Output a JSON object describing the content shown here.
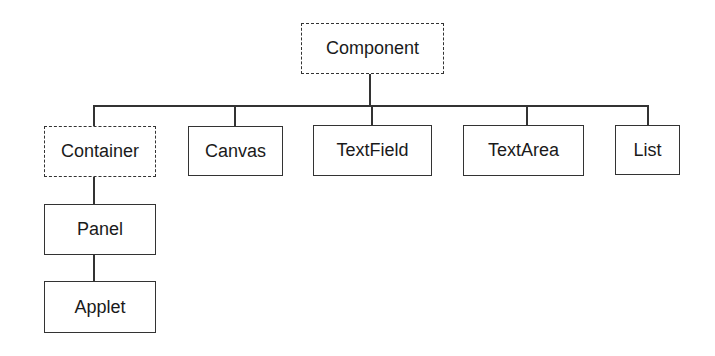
{
  "diagram": {
    "type": "class-hierarchy",
    "root": "Component",
    "nodes": [
      {
        "id": "component",
        "label": "Component",
        "style": "dashed",
        "abstract": true
      },
      {
        "id": "container",
        "label": "Container",
        "style": "dashed",
        "abstract": true,
        "parent": "component"
      },
      {
        "id": "canvas",
        "label": "Canvas",
        "style": "solid",
        "parent": "component"
      },
      {
        "id": "textfield",
        "label": "TextField",
        "style": "solid",
        "parent": "component"
      },
      {
        "id": "textarea",
        "label": "TextArea",
        "style": "solid",
        "parent": "component"
      },
      {
        "id": "list",
        "label": "List",
        "style": "solid",
        "parent": "component"
      },
      {
        "id": "panel",
        "label": "Panel",
        "style": "solid",
        "parent": "container"
      },
      {
        "id": "applet",
        "label": "Applet",
        "style": "solid",
        "parent": "panel"
      }
    ],
    "edges": [
      {
        "from": "component",
        "to": "container"
      },
      {
        "from": "component",
        "to": "canvas"
      },
      {
        "from": "component",
        "to": "textfield"
      },
      {
        "from": "component",
        "to": "textarea"
      },
      {
        "from": "component",
        "to": "list"
      },
      {
        "from": "container",
        "to": "panel"
      },
      {
        "from": "panel",
        "to": "applet"
      }
    ],
    "colors": {
      "stroke": "#333333",
      "text": "#1a1a1a",
      "background": "#ffffff"
    }
  }
}
